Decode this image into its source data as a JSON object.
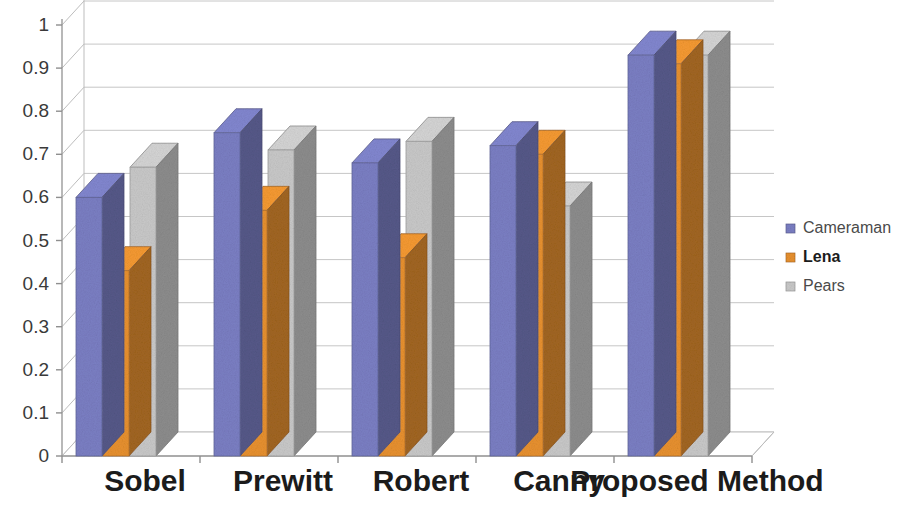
{
  "chart_data": {
    "type": "bar",
    "title": "",
    "xlabel": "",
    "ylabel": "",
    "categories": [
      "Sobel",
      "Prewitt",
      "Robert",
      "Canny",
      "Proposed Method"
    ],
    "series": [
      {
        "name": "Cameraman",
        "color": "#7b7fc4",
        "values": [
          0.6,
          0.75,
          0.68,
          0.72,
          0.93
        ]
      },
      {
        "name": "Lena",
        "color": "#e8912f",
        "values": [
          0.43,
          0.57,
          0.46,
          0.7,
          0.91
        ]
      },
      {
        "name": "Pears",
        "color": "#c9c9c9",
        "values": [
          0.67,
          0.71,
          0.73,
          0.58,
          0.93
        ]
      }
    ],
    "ylim": [
      0,
      1
    ],
    "yticks": [
      "0",
      "0.1",
      "0.2",
      "0.3",
      "0.4",
      "0.5",
      "0.6",
      "0.7",
      "0.8",
      "0.9",
      "1"
    ],
    "ytick_values": [
      0,
      0.1,
      0.2,
      0.3,
      0.4,
      0.5,
      0.6,
      0.7,
      0.8,
      0.9,
      1
    ],
    "grid": true,
    "legend_position": "right",
    "style": "3d-column"
  },
  "axis": {
    "y_tick_0": "0",
    "y_tick_1": "0.1",
    "y_tick_2": "0.2",
    "y_tick_3": "0.3",
    "y_tick_4": "0.4",
    "y_tick_5": "0.5",
    "y_tick_6": "0.6",
    "y_tick_7": "0.7",
    "y_tick_8": "0.8",
    "y_tick_9": "0.9",
    "y_tick_10": "1"
  },
  "xaxis": {
    "cat_0": "Sobel",
    "cat_1": "Prewitt",
    "cat_2": "Robert",
    "cat_3": "Canny",
    "cat_4": "Proposed Method"
  },
  "legend": {
    "item_0": "Cameraman",
    "item_1": "Lena",
    "item_2": "Pears"
  },
  "colors": {
    "cameraman": "#7b7fc4",
    "lena": "#e8912f",
    "pears": "#c9c9c9",
    "grid": "#b9b9b9",
    "axis": "#9a9a9a",
    "background": "#ffffff"
  }
}
